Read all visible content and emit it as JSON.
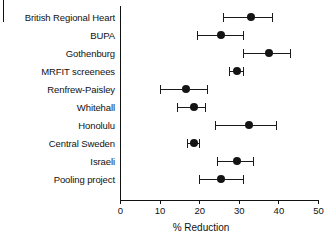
{
  "chart_data": {
    "type": "scatter",
    "subtype": "forest-plot",
    "title": "",
    "xlabel": "% Reduction",
    "ylabel": "",
    "xlim": [
      0,
      50
    ],
    "xticks": [
      0,
      10,
      20,
      30,
      40,
      50
    ],
    "xtick_labels": [
      "0",
      "10",
      "20",
      "30",
      "40",
      "50"
    ],
    "grid": false,
    "legend": null,
    "marker_color": "#141414",
    "line_color": "#1a1a1a",
    "categories": [
      "British Regional Heart",
      "BUPA",
      "Gothenburg",
      "MRFIT screenees",
      "Renfrew-Paisley",
      "Whitehall",
      "Honolulu",
      "Central Sweden",
      "Israeli",
      "Pooling project"
    ],
    "values": [
      33.0,
      25.5,
      37.5,
      29.5,
      16.5,
      18.5,
      32.5,
      18.5,
      29.5,
      25.5
    ],
    "ci_lower": [
      26.0,
      19.5,
      31.0,
      27.5,
      10.0,
      14.5,
      24.0,
      17.0,
      24.5,
      20.0
    ],
    "ci_upper": [
      38.5,
      31.0,
      43.0,
      31.0,
      22.0,
      21.5,
      39.5,
      20.0,
      33.5,
      31.0
    ],
    "points": [
      {
        "label": "British Regional Heart",
        "value": 33.0,
        "low": 26.0,
        "high": 38.5
      },
      {
        "label": "BUPA",
        "value": 25.5,
        "low": 19.5,
        "high": 31.0
      },
      {
        "label": "Gothenburg",
        "value": 37.5,
        "low": 31.0,
        "high": 43.0
      },
      {
        "label": "MRFIT screenees",
        "value": 29.5,
        "low": 27.5,
        "high": 31.0
      },
      {
        "label": "Renfrew-Paisley",
        "value": 16.5,
        "low": 10.0,
        "high": 22.0
      },
      {
        "label": "Whitehall",
        "value": 18.5,
        "low": 14.5,
        "high": 21.5
      },
      {
        "label": "Honolulu",
        "value": 32.5,
        "low": 24.0,
        "high": 39.5
      },
      {
        "label": "Central Sweden",
        "value": 18.5,
        "low": 17.0,
        "high": 20.0
      },
      {
        "label": "Israeli",
        "value": 29.5,
        "low": 24.5,
        "high": 33.5
      },
      {
        "label": "Pooling project",
        "value": 25.5,
        "low": 20.0,
        "high": 31.0
      }
    ]
  }
}
